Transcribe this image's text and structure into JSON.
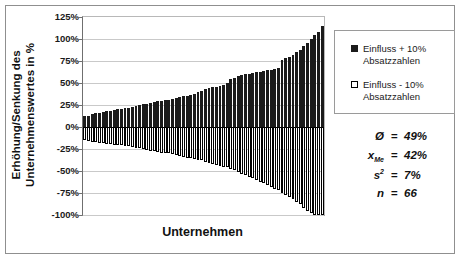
{
  "chart_data": {
    "type": "bar",
    "title": "",
    "xlabel": "Unternehmen",
    "ylabel": "Erhöhung/Senkung des Unternehmenswertes in %",
    "ylabel_line1": "Erhöhung/Senkung des",
    "ylabel_line2": "Unternehmenswertes in %",
    "ylim": [
      -100,
      125
    ],
    "ytick_step": 25,
    "yticks": [
      "125%",
      "100%",
      "75%",
      "50%",
      "25%",
      "0%",
      "-25%",
      "-50%",
      "-75%",
      "-100%"
    ],
    "ytick_values": [
      125,
      100,
      75,
      50,
      25,
      0,
      -25,
      -50,
      -75,
      -100
    ],
    "grid": true,
    "legend_position": "right",
    "n_bars": 66,
    "categories_label": "Unternehmen (n = 66, anonym)",
    "series": [
      {
        "name": "Einfluss + 10% Absatzzahlen",
        "color": "#1b1b1b",
        "values": [
          12,
          13,
          15,
          16,
          16,
          17,
          18,
          18,
          19,
          20,
          21,
          22,
          22,
          23,
          24,
          25,
          26,
          26,
          27,
          28,
          29,
          30,
          31,
          31,
          32,
          33,
          34,
          35,
          35,
          36,
          38,
          40,
          41,
          43,
          44,
          45,
          46,
          47,
          48,
          50,
          54,
          56,
          58,
          59,
          60,
          60,
          61,
          62,
          63,
          64,
          65,
          65,
          66,
          67,
          76,
          78,
          80,
          82,
          85,
          88,
          92,
          96,
          100,
          104,
          108,
          115
        ]
      },
      {
        "name": "Einfluss - 10% Absatzzahlen",
        "color": "#ffffff",
        "values": [
          -15,
          -16,
          -17,
          -17,
          -18,
          -18,
          -19,
          -19,
          -20,
          -20,
          -21,
          -22,
          -22,
          -23,
          -24,
          -24,
          -25,
          -26,
          -27,
          -27,
          -28,
          -29,
          -29,
          -30,
          -31,
          -32,
          -33,
          -34,
          -35,
          -35,
          -36,
          -37,
          -38,
          -40,
          -41,
          -42,
          -43,
          -44,
          -45,
          -46,
          -48,
          -49,
          -51,
          -53,
          -55,
          -57,
          -58,
          -60,
          -62,
          -64,
          -66,
          -68,
          -70,
          -72,
          -75,
          -77,
          -80,
          -82,
          -85,
          -88,
          -92,
          -95,
          -98,
          -100,
          -100,
          -100
        ]
      }
    ]
  },
  "legend": {
    "items": [
      {
        "line1": "Einfluss + 10%",
        "line2": "Absatzzahlen",
        "swatch": "filled-black"
      },
      {
        "line1": "Einfluss - 10%",
        "line2": "Absatzzahlen",
        "swatch": "hollow-white"
      }
    ]
  },
  "stats": {
    "rows": [
      {
        "symbol": "Ø",
        "sub": "",
        "sup": "",
        "eq": "=",
        "value": "49%"
      },
      {
        "symbol": "x",
        "sub": "Me",
        "sup": "",
        "eq": "=",
        "value": "42%"
      },
      {
        "symbol": "s",
        "sub": "",
        "sup": "2",
        "eq": "=",
        "value": "7%"
      },
      {
        "symbol": "n",
        "sub": "",
        "sup": "",
        "eq": "=",
        "value": "66"
      }
    ]
  },
  "colors": {
    "bar_positive": "#1b1b1b",
    "bar_negative_fill": "#ffffff",
    "bar_negative_border": "#000000",
    "gridline": "#c9c9c9",
    "zero_line": "#000000",
    "frame_border": "#8f8f8f",
    "text": "#1a1a1a"
  }
}
